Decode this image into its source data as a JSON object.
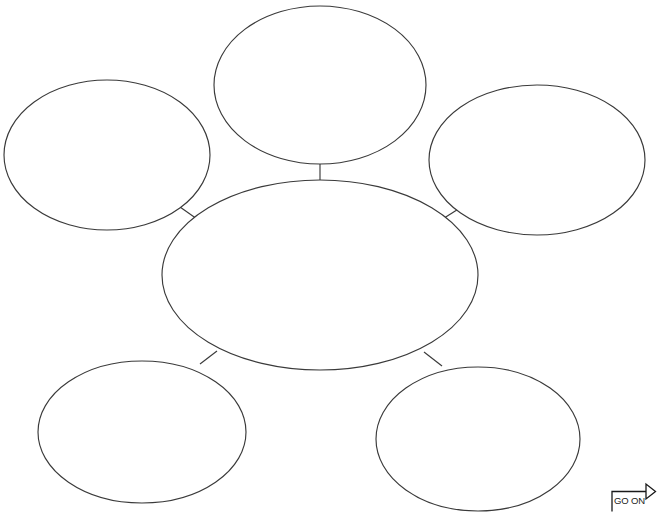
{
  "page": {
    "type": "graphic-organizer-worksheet",
    "title": "",
    "background_color": "#ffffff",
    "stroke_color": "#3a3a3a",
    "width": 657,
    "height": 512
  },
  "organizer": {
    "name": "bubble-map",
    "center": {
      "id": "center",
      "label": "",
      "cx": 320,
      "cy": 275,
      "rx": 158,
      "ry": 95
    },
    "bubbles": [
      {
        "id": "top",
        "label": "",
        "cx": 320,
        "cy": 85,
        "rx": 106,
        "ry": 79
      },
      {
        "id": "left",
        "label": "",
        "cx": 107,
        "cy": 155,
        "rx": 103,
        "ry": 75
      },
      {
        "id": "right",
        "label": "",
        "cx": 537,
        "cy": 160,
        "rx": 108,
        "ry": 75
      },
      {
        "id": "bottom-left",
        "label": "",
        "cx": 142,
        "cy": 432,
        "rx": 104,
        "ry": 71
      },
      {
        "id": "bottom-right",
        "label": "",
        "cx": 478,
        "cy": 439,
        "rx": 102,
        "ry": 72
      }
    ],
    "connectors": [
      {
        "id": "center-to-top",
        "x1": 320,
        "y1": 180,
        "x2": 320,
        "y2": 164
      },
      {
        "id": "center-to-left",
        "x1": 196,
        "y1": 218,
        "x2": 181,
        "y2": 208
      },
      {
        "id": "center-to-right",
        "x1": 442,
        "y1": 219,
        "x2": 459,
        "y2": 209
      },
      {
        "id": "center-to-bottom-left",
        "x1": 216,
        "y1": 352,
        "x2": 201,
        "y2": 364
      },
      {
        "id": "center-to-bottom-right",
        "x1": 425,
        "y1": 353,
        "x2": 441,
        "y2": 366
      }
    ]
  },
  "go_on": {
    "label": "GO ON",
    "arrow_direction": "up-right"
  }
}
